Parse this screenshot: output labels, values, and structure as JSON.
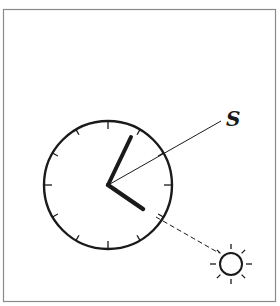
{
  "diagram": {
    "labels": {
      "south": "S"
    },
    "clock": {
      "center": [
        108,
        185
      ],
      "radius": 64,
      "tick_count": 12,
      "hour_hand_angle_deg": 120,
      "minute_hand_angle_deg": 25,
      "color": "#1a1a1a"
    },
    "south_line": {
      "from": [
        108,
        185
      ],
      "to": [
        222,
        120
      ]
    },
    "sun_line": {
      "from": [
        155,
        216
      ],
      "to": [
        218,
        252
      ],
      "style": "dashed"
    },
    "sun": {
      "center": [
        231,
        264
      ],
      "radius": 11,
      "ray_count": 8,
      "icon": "sun-icon"
    },
    "frame": {
      "color": "#8a8a8a"
    }
  }
}
